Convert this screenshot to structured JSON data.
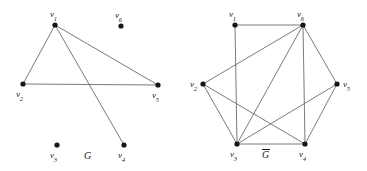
{
  "figure": {
    "background_color": "#ffffff",
    "edge_color": "#6b6b6b",
    "vertex_color": "#161616",
    "label_color": "#1a1a1a",
    "width": 367,
    "height": 171
  },
  "graphs": [
    {
      "id": "G",
      "caption": "G",
      "caption_overline": false,
      "caption_pos": {
        "x": 84,
        "y": 151
      },
      "vertices": [
        {
          "id": "v1",
          "name": "v",
          "sub": "1",
          "x": 55,
          "y": 25,
          "label_x": 50,
          "label_y": 10
        },
        {
          "id": "v2",
          "name": "v",
          "sub": "2",
          "x": 23,
          "y": 84,
          "label_x": 16,
          "label_y": 90
        },
        {
          "id": "v3",
          "name": "v",
          "sub": "3",
          "x": 57,
          "y": 145,
          "label_x": 50,
          "label_y": 151
        },
        {
          "id": "v4",
          "name": "v",
          "sub": "4",
          "x": 124,
          "y": 145,
          "label_x": 118,
          "label_y": 151
        },
        {
          "id": "v5",
          "name": "v",
          "sub": "5",
          "x": 158,
          "y": 85,
          "label_x": 152,
          "label_y": 91
        },
        {
          "id": "v6",
          "name": "v",
          "sub": "6",
          "x": 121,
          "y": 26,
          "label_x": 115,
          "label_y": 11
        }
      ],
      "edges": [
        [
          "v1",
          "v2"
        ],
        [
          "v1",
          "v5"
        ],
        [
          "v1",
          "v4"
        ],
        [
          "v2",
          "v5"
        ]
      ]
    },
    {
      "id": "Gbar",
      "caption": "G",
      "caption_overline": true,
      "caption_pos": {
        "x": 262,
        "y": 150
      },
      "vertices": [
        {
          "id": "v1",
          "name": "v",
          "sub": "1",
          "x": 235,
          "y": 25,
          "label_x": 229,
          "label_y": 10
        },
        {
          "id": "v2",
          "name": "v",
          "sub": "2",
          "x": 203,
          "y": 84,
          "label_x": 190,
          "label_y": 80
        },
        {
          "id": "v3",
          "name": "v",
          "sub": "3",
          "x": 237,
          "y": 144,
          "label_x": 230,
          "label_y": 150
        },
        {
          "id": "v4",
          "name": "v",
          "sub": "4",
          "x": 305,
          "y": 144,
          "label_x": 299,
          "label_y": 150
        },
        {
          "id": "v5",
          "name": "v",
          "sub": "5",
          "x": 337,
          "y": 84,
          "label_x": 343,
          "label_y": 80
        },
        {
          "id": "v6",
          "name": "v",
          "sub": "6",
          "x": 303,
          "y": 25,
          "label_x": 297,
          "label_y": 10
        }
      ],
      "edges": [
        [
          "v1",
          "v3"
        ],
        [
          "v1",
          "v6"
        ],
        [
          "v2",
          "v3"
        ],
        [
          "v2",
          "v4"
        ],
        [
          "v2",
          "v6"
        ],
        [
          "v3",
          "v4"
        ],
        [
          "v3",
          "v5"
        ],
        [
          "v3",
          "v6"
        ],
        [
          "v4",
          "v5"
        ],
        [
          "v4",
          "v6"
        ],
        [
          "v5",
          "v6"
        ]
      ]
    }
  ]
}
